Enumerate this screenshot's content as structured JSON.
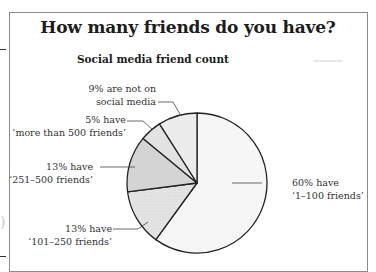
{
  "title": "How many friends do you have?",
  "subtitle": "Social media friend count",
  "chart_data": {
    "type": "pie",
    "title": "How many friends do you have?",
    "subtitle": "Social media friend count",
    "start_angle_deg": 0,
    "direction": "clockwise",
    "slices": [
      {
        "label": "1–100 friends",
        "value": 60,
        "annotation_line1": "60% have",
        "annotation_line2": "‘1–100 friends’",
        "color": "#f6f6f6"
      },
      {
        "label": "101–250 friends",
        "value": 13,
        "annotation_line1": "13% have",
        "annotation_line2": "‘101–250 friends’",
        "color": "#e6e6e6"
      },
      {
        "label": "251–500 friends",
        "value": 13,
        "annotation_line1": "13% have",
        "annotation_line2": "‘251–500 friends’",
        "color": "#d4d4d4"
      },
      {
        "label": "more than 500 friends",
        "value": 5,
        "annotation_line1": "5% have",
        "annotation_line2": "‘more than 500 friends’",
        "color": "#e2e2e2"
      },
      {
        "label": "not on social media",
        "value": 9,
        "annotation_line1": "9% are not on",
        "annotation_line2": "social media",
        "color": "#ececec"
      }
    ]
  },
  "labels": {
    "s60": {
      "l1": "60% have",
      "l2": "‘1–100 friends’"
    },
    "s13a": {
      "l1": "13% have",
      "l2": "‘101–250 friends’"
    },
    "s13b": {
      "l1": "13% have",
      "l2": "‘251–500 friends’"
    },
    "s5": {
      "l1": "5% have",
      "l2": "‘more than 500 friends’"
    },
    "s9": {
      "l1": "9% are not on",
      "l2": "social media"
    }
  },
  "colors": {
    "outline": "#222222",
    "frame": "#8a8a8a",
    "text": "#1c1c1c"
  }
}
